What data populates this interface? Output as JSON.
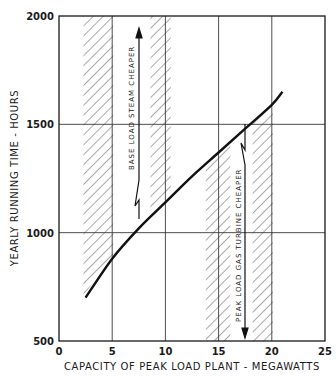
{
  "chart_data": {
    "type": "line",
    "title": "",
    "xlabel": "CAPACITY OF PEAK LOAD PLANT - MEGAWATTS",
    "ylabel": "YEARLY RUNNING TIME - HOURS",
    "xlim": [
      0,
      25
    ],
    "ylim": [
      500,
      2000
    ],
    "x_ticks": [
      0,
      5,
      10,
      15,
      20,
      25
    ],
    "y_ticks": [
      500,
      1000,
      1500,
      2000
    ],
    "grid": true,
    "legend": null,
    "series": [
      {
        "name": "Break-even curve",
        "x": [
          2.5,
          5,
          7.5,
          10,
          12.5,
          15,
          17.5,
          20,
          21
        ],
        "y": [
          700,
          880,
          1020,
          1140,
          1260,
          1370,
          1480,
          1590,
          1650
        ]
      }
    ],
    "regions": [
      {
        "type": "hatched",
        "x": [
          2.3,
          5.1
        ],
        "position": "above curve"
      },
      {
        "type": "hatched",
        "x": [
          8.6,
          10.5
        ],
        "position": "above curve"
      },
      {
        "type": "hatched",
        "x": [
          13.8,
          16.1
        ],
        "position": "below curve"
      },
      {
        "type": "hatched",
        "x": [
          18.2,
          20.1
        ],
        "position": "below curve"
      }
    ],
    "annotations": [
      {
        "text": "BASE LOAD STEAM CHEAPER",
        "x": 7.6,
        "direction": "up",
        "arrow": true
      },
      {
        "text": "PEAK LOAD GAS TURBINE CHEAPER",
        "x": 17.6,
        "direction": "down",
        "arrow": true
      }
    ]
  },
  "labels": {
    "xlabel": "CAPACITY OF PEAK LOAD PLANT - MEGAWATTS",
    "ylabel": "YEARLY RUNNING TIME - HOURS",
    "base_anno": "BASE  LOAD  STEAM  CHEAPER",
    "peak_anno": "PEAK  LOAD  GAS  TURBINE  CHEAPER"
  },
  "colors": {
    "ink": "#1a1a1a",
    "grid": "#3a3a3a",
    "hatch": "#555555",
    "background": "#ffffff"
  }
}
